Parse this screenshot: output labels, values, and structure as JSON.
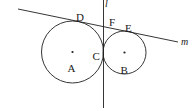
{
  "figure": {
    "kind": "geometry-diagram",
    "width": 195,
    "height": 111,
    "background_color": "#ffffff",
    "stroke_color": "#1f1f1f",
    "label_color": "#1a1a1a"
  },
  "labels": {
    "A": "A",
    "B": "B",
    "C": "C",
    "D": "D",
    "E": "E",
    "F": "F",
    "line_l": "l",
    "line_m": "m"
  },
  "chart_data": {
    "type": "scatter",
    "title": "",
    "xlabel": "",
    "ylabel": "",
    "circles": [
      {
        "name": "A",
        "cx": 72.5,
        "cy": 52.0,
        "r": 31.0
      },
      {
        "name": "B",
        "cx": 124.5,
        "cy": 52.5,
        "r": 21.5
      }
    ],
    "points": [
      {
        "name": "A",
        "x": 72.5,
        "y": 52.0,
        "dot": true,
        "label_dx": -5,
        "label_dy": 11
      },
      {
        "name": "B",
        "x": 124.5,
        "y": 52.5,
        "dot": true,
        "label_dx": -4,
        "label_dy": 12
      },
      {
        "name": "C",
        "x": 103.5,
        "y": 53.0,
        "dot": false,
        "label_dx": -11,
        "label_dy": -2
      },
      {
        "name": "D",
        "x": 80.0,
        "y": 22.0,
        "dot": false,
        "label_dx": -4,
        "label_dy": -10
      },
      {
        "name": "E",
        "x": 128.0,
        "y": 32.0,
        "dot": false,
        "label_dx": -3,
        "label_dy": -9
      },
      {
        "name": "F",
        "x": 108.0,
        "y": 26.0,
        "dot": false,
        "label_dx": 1,
        "label_dy": -9
      }
    ],
    "lines": [
      {
        "name": "l",
        "x1": 103.5,
        "y1": 0.0,
        "x2": 103.5,
        "y2": 108.0
      },
      {
        "name": "m",
        "x1": 18.0,
        "y1": 9.0,
        "x2": 178.0,
        "y2": 42.0
      }
    ],
    "annotations": [
      "Two mutually tangent circles A and B meet at point C on vertical line l",
      "Line m is a common external tangent touching circle A at D and circle B at E",
      "Point F is the intersection of line m and vertical line l"
    ]
  }
}
